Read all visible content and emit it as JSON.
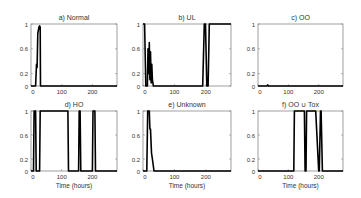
{
  "chart_data": [
    {
      "type": "line",
      "title": "a) Normal",
      "xlabel": "",
      "ylabel": "",
      "xlim": [
        0,
        280
      ],
      "ylim": [
        0,
        1
      ],
      "xticks": [
        0,
        100,
        200
      ],
      "yticks": [
        0,
        0.2,
        0.6,
        1
      ],
      "grid": false,
      "x": [
        0,
        15,
        18,
        20,
        22,
        24,
        26,
        28,
        30,
        31,
        280
      ],
      "y": [
        0,
        0,
        0.35,
        0.3,
        0.85,
        0.9,
        0.95,
        0.97,
        0.95,
        0,
        0
      ]
    },
    {
      "type": "line",
      "title": "b) UL",
      "xlabel": "",
      "ylabel": "",
      "xlim": [
        0,
        280
      ],
      "ylim": [
        0,
        1
      ],
      "xticks": [
        0,
        100,
        200
      ],
      "yticks": [
        0,
        0.2,
        0.6,
        1
      ],
      "grid": false,
      "x": [
        0,
        5,
        9,
        14,
        16,
        18,
        20,
        22,
        24,
        26,
        28,
        30,
        33,
        190,
        195,
        199,
        203,
        207,
        211,
        280
      ],
      "y": [
        1,
        1,
        0,
        0,
        0.6,
        0.2,
        0.7,
        0.1,
        0.55,
        0.05,
        0.35,
        0.1,
        0,
        0,
        1,
        1,
        0,
        0,
        1,
        1
      ]
    },
    {
      "type": "line",
      "title": "c) OO",
      "xlabel": "",
      "ylabel": "",
      "xlim": [
        0,
        280
      ],
      "ylim": [
        0,
        1
      ],
      "xticks": [
        0,
        100,
        200
      ],
      "yticks": [
        0,
        0.2,
        0.6,
        1
      ],
      "grid": false,
      "x": [
        0,
        30,
        32,
        34,
        280
      ],
      "y": [
        0,
        0,
        0.02,
        0,
        0
      ]
    },
    {
      "type": "line",
      "title": "d) HO",
      "xlabel": "Time (hours)",
      "ylabel": "",
      "xlim": [
        0,
        280
      ],
      "ylim": [
        0,
        1
      ],
      "xticks": [
        0,
        100,
        200
      ],
      "yticks": [
        0,
        0.2,
        0.6,
        1
      ],
      "grid": false,
      "x": [
        0,
        8,
        10,
        15,
        17,
        28,
        30,
        120,
        122,
        155,
        157,
        160,
        162,
        200,
        202,
        208,
        210,
        280
      ],
      "y": [
        0,
        0,
        1,
        1,
        0,
        0,
        1,
        1,
        0,
        0,
        1,
        1,
        0,
        0,
        1,
        1,
        0,
        0
      ]
    },
    {
      "type": "line",
      "title": "e) Unknown",
      "xlabel": "Time (hours)",
      "ylabel": "",
      "xlim": [
        0,
        280
      ],
      "ylim": [
        0,
        1
      ],
      "xticks": [
        0,
        100,
        200
      ],
      "yticks": [
        0,
        0.2,
        0.6,
        1
      ],
      "grid": false,
      "x": [
        0,
        12,
        15,
        20,
        22,
        24,
        27,
        30,
        35,
        280
      ],
      "y": [
        0,
        0,
        1,
        1,
        0.7,
        0.7,
        0.3,
        0.2,
        0,
        0
      ]
    },
    {
      "type": "line",
      "title": "f) OO ∪ Tox",
      "xlabel": "Time (hours)",
      "ylabel": "",
      "xlim": [
        0,
        280
      ],
      "ylim": [
        0,
        1
      ],
      "xticks": [
        0,
        100,
        200
      ],
      "yticks": [
        0,
        0.2,
        0.6,
        1
      ],
      "grid": false,
      "x": [
        0,
        118,
        120,
        153,
        155,
        158,
        160,
        190,
        200,
        202,
        206,
        208,
        212,
        214,
        280
      ],
      "y": [
        0,
        0,
        1,
        1,
        0,
        0,
        1,
        1,
        0,
        0,
        1,
        1,
        0,
        0,
        0
      ]
    }
  ],
  "panels": [
    {
      "title": "a) Normal"
    },
    {
      "title": "b) UL"
    },
    {
      "title": "c) OO"
    },
    {
      "title": "d) HO",
      "xlabel": "Time (hours)"
    },
    {
      "title": "e) Unknown",
      "xlabel": "Time (hours)"
    },
    {
      "title": "f) OO ∪ Tox",
      "xlabel": "Time (hours)"
    }
  ],
  "tick_labels": {
    "y": [
      "0",
      "0.2",
      "0.6",
      "1"
    ],
    "x": [
      "0",
      "100",
      "200"
    ]
  }
}
